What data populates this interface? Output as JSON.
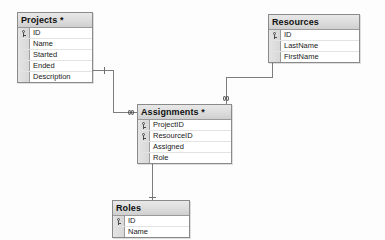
{
  "diagram": {
    "background_color": "#fdfdfd",
    "line_color": "#7d7d7d",
    "header_color": "#dcdcdc"
  },
  "entities": [
    {
      "id": "projects",
      "name": "Projects *",
      "x": 17,
      "y": 12,
      "width": 76,
      "height": 64,
      "fields": [
        {
          "name": "ID",
          "key": true
        },
        {
          "name": "Name",
          "key": false
        },
        {
          "name": "Started",
          "key": false
        },
        {
          "name": "Ended",
          "key": false
        },
        {
          "name": "Description",
          "key": false
        }
      ]
    },
    {
      "id": "resources",
      "name": "Resources",
      "x": 268,
      "y": 14,
      "width": 92,
      "height": 45,
      "fields": [
        {
          "name": "ID",
          "key": true
        },
        {
          "name": "LastName",
          "key": false
        },
        {
          "name": "FirstName",
          "key": false
        }
      ]
    },
    {
      "id": "assignments",
      "name": "Assignments *",
      "x": 137,
      "y": 104,
      "width": 95,
      "height": 55,
      "fields": [
        {
          "name": "ProjectID",
          "key": true
        },
        {
          "name": "ResourceID",
          "key": true
        },
        {
          "name": "Assigned",
          "key": false
        },
        {
          "name": "Role",
          "key": false
        }
      ]
    },
    {
      "id": "roles",
      "name": "Roles",
      "x": 112,
      "y": 200,
      "width": 78,
      "height": 32,
      "fields": [
        {
          "name": "ID",
          "key": true
        },
        {
          "name": "Name",
          "key": false
        }
      ]
    }
  ],
  "relationships": [
    {
      "id": "projects-assignments",
      "from": "Projects",
      "to": "Assignments",
      "from_cardinality": "1",
      "to_cardinality": "many"
    },
    {
      "id": "resources-assignments",
      "from": "Resources",
      "to": "Assignments",
      "from_cardinality": "1",
      "to_cardinality": "many"
    },
    {
      "id": "roles-assignments",
      "from": "Roles",
      "to": "Assignments",
      "from_cardinality": "1",
      "to_cardinality": "many"
    }
  ]
}
